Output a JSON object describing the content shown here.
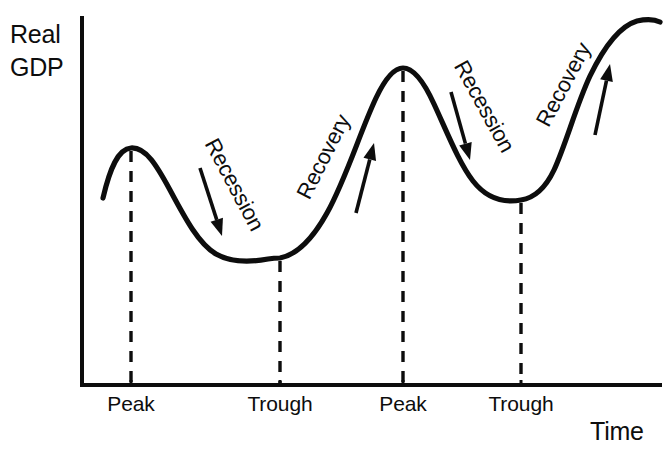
{
  "figure": {
    "background_color": "#ffffff",
    "ink_color": "#0d0d0d"
  },
  "axes": {
    "y_label_line1": "Real",
    "y_label_line2": "GDP",
    "x_label": "Time"
  },
  "tick_labels": [
    {
      "label": "Peak",
      "x": 131
    },
    {
      "label": "Trough",
      "x": 280
    },
    {
      "label": "Peak",
      "x": 403
    },
    {
      "label": "Trough",
      "x": 521
    }
  ],
  "phases": [
    {
      "label": "Recession",
      "rotation": 62,
      "text_x": 228,
      "text_y": 188,
      "direction": "down"
    },
    {
      "label": "Recovery",
      "rotation": -63,
      "text_x": 330,
      "text_y": 160,
      "direction": "up"
    },
    {
      "label": "Recession",
      "rotation": 61,
      "text_x": 478,
      "text_y": 110,
      "direction": "down"
    },
    {
      "label": "Recovery",
      "rotation": -62,
      "text_x": 570,
      "text_y": 88,
      "direction": "up"
    }
  ],
  "chart_data": {
    "type": "line",
    "xlabel": "Time",
    "ylabel": "Real GDP",
    "grid": false,
    "legend": false,
    "axis_ranges": {
      "x": [
        82,
        660
      ],
      "y": [
        18,
        385
      ]
    },
    "annotations": [
      "Recession",
      "Recovery",
      "Recession",
      "Recovery"
    ],
    "categories": [
      "Peak",
      "Trough",
      "Peak",
      "Trough"
    ],
    "turning_points": [
      {
        "name": "Peak",
        "x": 131,
        "y": 148
      },
      {
        "name": "Trough",
        "x": 280,
        "y": 258
      },
      {
        "name": "Peak",
        "x": 403,
        "y": 68
      },
      {
        "name": "Trough",
        "x": 521,
        "y": 200
      }
    ],
    "curve_path": "M 103 198 C 110 168 118 149 131 148 C 146 147 157 166 170 190 C 186 220 199 244 216 254 C 232 263 252 262 268 259 C 274 258 277 258 280 258 C 296 255 312 240 327 213 C 346 179 360 132 376 98 C 385 79 394 68 403 68 C 414 68 424 82 434 104 C 447 132 459 163 473 181 C 487 199 504 203 521 200 C 534 198 545 189 554 170 C 566 144 576 106 590 76 C 604 47 620 26 637 21 C 646 19 654 19 660 22"
  }
}
